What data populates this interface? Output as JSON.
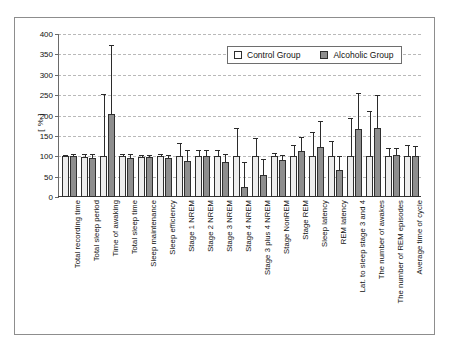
{
  "chart": {
    "type": "bar",
    "title": "",
    "ylabel": "[ % ]",
    "xlabel": ""
  },
  "legend": {
    "position": "top-right",
    "entries": [
      {
        "label": "Control Group",
        "color": "#ffffff",
        "icon": "legend-swatch-control"
      },
      {
        "label": "Alcoholic Group",
        "color": "#8e8e8e",
        "icon": "legend-swatch-alcoholic"
      }
    ]
  },
  "yaxis": {
    "min": 0,
    "max": 400,
    "step": 50,
    "ticks": [
      "0",
      "50",
      "100",
      "150",
      "200",
      "250",
      "300",
      "350",
      "400"
    ]
  },
  "chart_data": {
    "type": "bar",
    "title": "",
    "xlabel": "",
    "ylabel": "[ % ]",
    "ylim": [
      0,
      400
    ],
    "yticks": [
      0,
      50,
      100,
      150,
      200,
      250,
      300,
      350,
      400
    ],
    "grid": true,
    "legend_position": "top-right",
    "categories": [
      "Total recording time",
      "Total sleep period",
      "Time of awaking",
      "Total sleep time",
      "Sleep maintenance",
      "Sleep efficiency",
      "Stage 1 NREM",
      "Stage 2 NREM",
      "Stage 3 NREM",
      "Stage 4 NREM",
      "Stage 3 plus 4 NREM",
      "Stage NonREM",
      "Stage REM",
      "Sleep latency",
      "REM latency",
      "Lat. to sleep stage 3 and 4",
      "The number of awakes",
      "The number of REM episodes",
      "Average time of cycle"
    ],
    "series": [
      {
        "name": "Control Group",
        "color": "#ededed",
        "values": [
          100,
          97,
          100,
          100,
          99,
          100,
          100,
          100,
          100,
          100,
          100,
          100,
          100,
          100,
          100,
          100,
          100,
          100,
          100
        ],
        "errors_upper": [
          101,
          103,
          250,
          103,
          101,
          102,
          131,
          112,
          113,
          166,
          142,
          106,
          125,
          158,
          135,
          191,
          208,
          117,
          126
        ]
      },
      {
        "name": "Alcoholic Group",
        "color": "#8e8e8e",
        "values": [
          100,
          95,
          203,
          96,
          97,
          96,
          88,
          100,
          86,
          25,
          55,
          92,
          112,
          122,
          67,
          166,
          170,
          102,
          100
        ],
        "errors_upper": [
          103,
          103,
          370,
          102,
          101,
          101,
          113,
          113,
          103,
          84,
          92,
          100,
          146,
          185,
          99,
          252,
          248,
          117,
          122
        ]
      }
    ]
  }
}
